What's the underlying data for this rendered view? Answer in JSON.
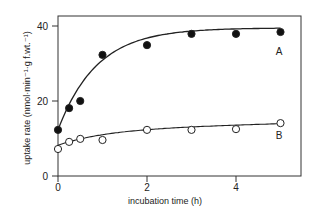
{
  "chart_data": {
    "type": "line",
    "title": "",
    "xlabel": "incubation time (h)",
    "ylabel": "uptake rate (nmol·min⁻¹·g f.wt.⁻¹)",
    "xlim": [
      -0.05,
      5.45
    ],
    "ylim": [
      0,
      42.5
    ],
    "xticks": [
      0,
      2,
      4
    ],
    "yticks": [
      0,
      20,
      40
    ],
    "grid": false,
    "legend": "inline labels at right end of curves",
    "series": [
      {
        "name": "A",
        "marker": "filled-circle",
        "x": [
          0,
          0.25,
          0.5,
          1,
          2,
          3,
          4,
          5
        ],
        "y": [
          12.3,
          18.1,
          20.0,
          32.3,
          34.9,
          37.9,
          37.9,
          38.4
        ],
        "fit_curve": "saturating (hyperbolic) fit"
      },
      {
        "name": "B",
        "marker": "open-circle",
        "x": [
          0,
          0.25,
          0.5,
          1,
          2,
          3,
          4,
          5
        ],
        "y": [
          7.2,
          9.1,
          9.9,
          9.6,
          12.3,
          12.3,
          12.5,
          14.1
        ],
        "fit_curve": "gently rising fit"
      }
    ]
  },
  "labels": {
    "xlabel": "incubation time (h)",
    "ylabel": "uptake rate (nmol·min⁻¹·g f.wt.⁻¹)",
    "series_a": "A",
    "series_b": "B"
  }
}
